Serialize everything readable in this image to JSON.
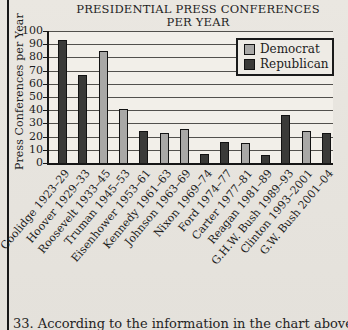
{
  "title": {
    "line1": "PRESIDENTIAL PRESS CONFERENCES",
    "line2": "PER YEAR"
  },
  "question": {
    "text": "33. According to the information in the chart above"
  },
  "colors": {
    "democrat": "#a9a8a6",
    "republican": "#3a3a38",
    "plot_background": "#f2efe9",
    "page_background": "#e7e4de",
    "gridline": "#52504c",
    "axis": "#161616"
  },
  "chart_data": {
    "type": "bar",
    "title": "PRESIDENTIAL PRESS CONFERENCES PER YEAR",
    "xlabel": "",
    "ylabel": "Press Conferences per Year",
    "ylim": [
      0,
      100
    ],
    "yticks": [
      0,
      10,
      20,
      30,
      40,
      50,
      60,
      70,
      80,
      90,
      100
    ],
    "grid": true,
    "legend_position": "top-right",
    "legend": [
      {
        "label": "Democrat",
        "color": "#a9a8a6"
      },
      {
        "label": "Republican",
        "color": "#3a3a38"
      }
    ],
    "categories": [
      "Coolidge 1923–29",
      "Hoover 1929–33",
      "Roosevelt 1933–45",
      "Truman 1945–53",
      "Eisenhower 1953–61",
      "Kennedy 1961–63",
      "Johnson 1963–69",
      "Nixon 1969–74",
      "Ford 1974–77",
      "Carter 1977–81",
      "Reagan 1981–89",
      "G.H.W. Bush 1989–93",
      "Clinton 1993–2001",
      "G.W. Bush 2001–04"
    ],
    "bars": [
      {
        "category": "Coolidge 1923–29",
        "party": "Republican",
        "value": 93
      },
      {
        "category": "Hoover 1929–33",
        "party": "Republican",
        "value": 67
      },
      {
        "category": "Roosevelt 1933–45",
        "party": "Democrat",
        "value": 85
      },
      {
        "category": "Truman 1945–53",
        "party": "Democrat",
        "value": 41
      },
      {
        "category": "Eisenhower 1953–61",
        "party": "Republican",
        "value": 24
      },
      {
        "category": "Kennedy 1961–63",
        "party": "Democrat",
        "value": 23
      },
      {
        "category": "Johnson 1963–69",
        "party": "Democrat",
        "value": 26
      },
      {
        "category": "Nixon 1969–74",
        "party": "Republican",
        "value": 7
      },
      {
        "category": "Ford 1974–77",
        "party": "Republican",
        "value": 16
      },
      {
        "category": "Carter 1977–81",
        "party": "Democrat",
        "value": 15
      },
      {
        "category": "Reagan 1981–89",
        "party": "Republican",
        "value": 6
      },
      {
        "category": "G.H.W. Bush 1989–93",
        "party": "Republican",
        "value": 36
      },
      {
        "category": "Clinton 1993–2001",
        "party": "Democrat",
        "value": 24
      },
      {
        "category": "G.W. Bush 2001–04",
        "party": "Republican",
        "value": 23
      }
    ]
  }
}
